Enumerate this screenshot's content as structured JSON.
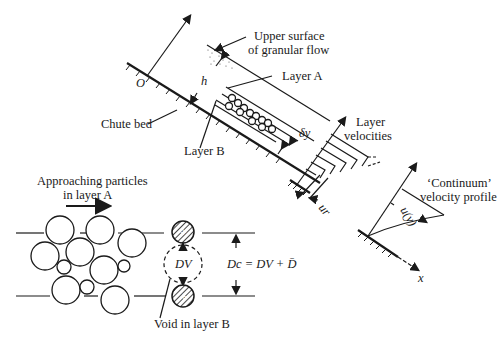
{
  "figure": {
    "labels": {
      "origin": "O",
      "upper_surface_line1": "Upper surface",
      "upper_surface_line2": "of granular flow",
      "layer_a": "Layer A",
      "layer_b": "Layer B",
      "chute_bed": "Chute bed",
      "depth_h": "h",
      "delta_y": "δy",
      "layer_velocities_line1": "Layer",
      "layer_velocities_line2": "velocities",
      "u_r": "ur",
      "continuum_line1": "‘Continuum’",
      "continuum_line2": "velocity profile",
      "u_of_y": "u(y)",
      "x_axis": "x",
      "approaching_line1": "Approaching particles",
      "approaching_line2": "in layer A",
      "void_diameter": "DV",
      "critical_diameter_eq": "Dc = DV + D̄",
      "void_label": "Void in layer B"
    }
  }
}
